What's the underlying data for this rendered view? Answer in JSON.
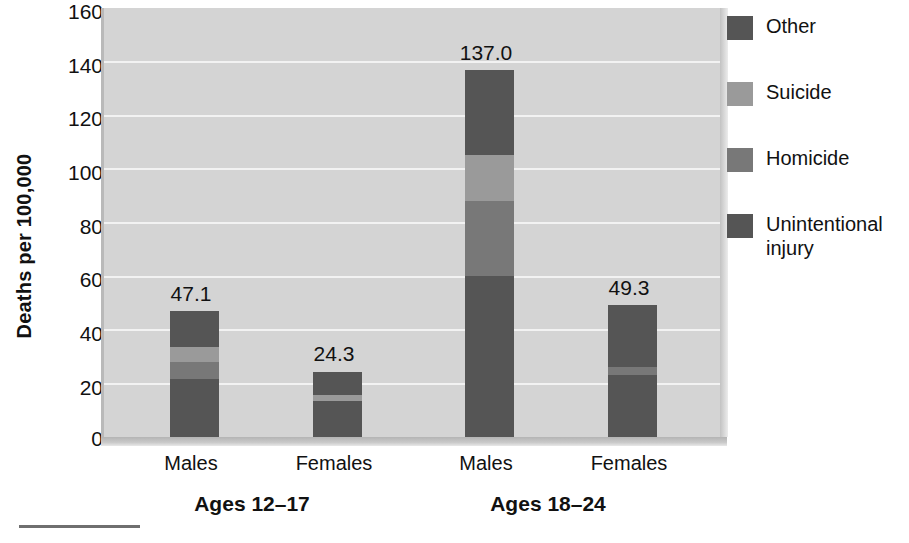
{
  "chart_data": {
    "type": "bar",
    "title": "",
    "subtitle": "",
    "xlabel": "",
    "ylabel": "Deaths per 100,000",
    "ylim": [
      0,
      160
    ],
    "yticks": [
      160,
      140,
      120,
      100,
      80,
      60,
      40,
      20,
      0
    ],
    "grid": true,
    "stacked": true,
    "legend_position": "right",
    "legend": [
      "Other",
      "Suicide",
      "Homicide",
      "Unintentional injury"
    ],
    "categories": [
      "Males",
      "Females",
      "Males",
      "Females"
    ],
    "groups": [
      {
        "label": "Ages 12–17",
        "categories": [
          "Males",
          "Females"
        ]
      },
      {
        "label": "Ages 18–24",
        "categories": [
          "Males",
          "Females"
        ]
      }
    ],
    "totals": [
      "47.1",
      "24.3",
      "137.0",
      "49.3"
    ],
    "series": [
      {
        "name": "Unintentional injury",
        "color": "#555555",
        "values": [
          21.5,
          13.5,
          60.0,
          23.0
        ]
      },
      {
        "name": "Homicide",
        "color": "#787878",
        "values": [
          6.5,
          0.0,
          28.0,
          3.0
        ]
      },
      {
        "name": "Suicide",
        "color": "#9a9a9a",
        "values": [
          5.5,
          2.0,
          17.0,
          0.0
        ]
      },
      {
        "name": "Other",
        "color": "#555555",
        "values": [
          13.6,
          8.8,
          32.0,
          23.3
        ]
      }
    ]
  },
  "axis": {
    "y_title": "Deaths per 100,000",
    "ticks": {
      "t160": "160",
      "t140": "140",
      "t120": "120",
      "t100": "100",
      "t80": "80",
      "t60": "60",
      "t40": "40",
      "t20": "20",
      "t0": "0"
    }
  },
  "bars": [
    {
      "value_label": "47.1",
      "category": "Males"
    },
    {
      "value_label": "24.3",
      "category": "Females"
    },
    {
      "value_label": "137.0",
      "category": "Males"
    },
    {
      "value_label": "49.3",
      "category": "Females"
    }
  ],
  "groups": [
    {
      "label": "Ages 12–17"
    },
    {
      "label": "Ages 18–24"
    }
  ],
  "legend": {
    "items": [
      {
        "label": "Other",
        "color": "#555555"
      },
      {
        "label": "Suicide",
        "color": "#9a9a9a"
      },
      {
        "label": "Homicide",
        "color": "#787878"
      },
      {
        "label": "Unintentional injury",
        "color": "#555555"
      }
    ]
  },
  "colors": {
    "plot_background": "#d4d4d4",
    "gridline": "#f2f2f2",
    "text": "#111111"
  }
}
